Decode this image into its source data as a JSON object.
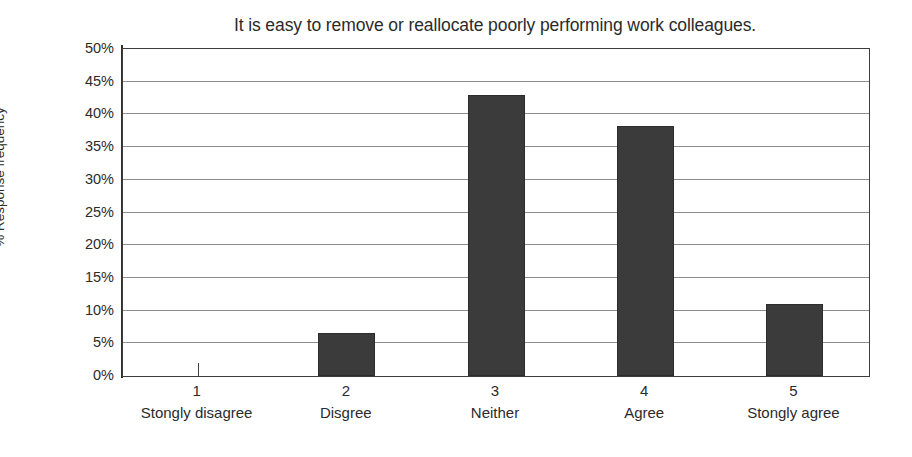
{
  "chart_data": {
    "type": "bar",
    "title": "It is easy to remove or reallocate poorly performing work colleagues.",
    "xlabel": "",
    "ylabel": "% Response frequency",
    "categories": [
      "1",
      "2",
      "3",
      "4",
      "5"
    ],
    "category_descriptions": [
      "Stongly disagree",
      "Disgree",
      "Neither",
      "Agree",
      "Stongly agree"
    ],
    "values": [
      0,
      6.6,
      43,
      38.3,
      11
    ],
    "value_labels": [
      "0%",
      "6.6%",
      "43%",
      "38.3%",
      "11%"
    ],
    "ylim": [
      0,
      50
    ],
    "ytick_values": [
      50,
      45,
      40,
      35,
      30,
      25,
      20,
      15,
      10,
      5,
      0
    ],
    "ytick_labels": [
      "50%",
      "45%",
      "40%",
      "35%",
      "30%",
      "25%",
      "20%",
      "15%",
      "10%",
      "5%",
      "0%"
    ],
    "grid": true,
    "grid_axis": "y",
    "legend": false,
    "legend_position": "none",
    "bar_color": "#3b3b3b",
    "bar_edge_color": "#2c2c2c",
    "gridline_color": "#8d8d8d",
    "axis_color": "#3d3d3d",
    "background_color": "#ffffff",
    "text_color": "#2b2b2b"
  }
}
